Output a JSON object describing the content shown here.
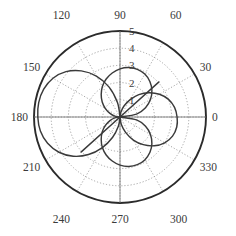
{
  "figure": {
    "kind": "polar-plot",
    "background_color": "#ffffff",
    "grid_color": "#8a8a8a",
    "outer_circle_color": "#2b2b2b",
    "curve_color": "#3a3a3a",
    "label_color": "#3b3b3b",
    "center": {
      "x": 120,
      "y": 117
    },
    "outer_radius_px": 86
  },
  "chart_data": {
    "type": "line",
    "plot_kind": "polar",
    "title": "",
    "xlabel": "",
    "ylabel": "",
    "grid": true,
    "legend_position": "none",
    "theta_unit": "degrees",
    "theta_tick_labels": [
      "0",
      "30",
      "60",
      "90",
      "120",
      "150",
      "180",
      "210",
      "240",
      "270",
      "300",
      "330"
    ],
    "theta_ticks": [
      0,
      30,
      60,
      90,
      120,
      150,
      180,
      210,
      240,
      270,
      300,
      330
    ],
    "r_tick_labels": [
      "1",
      "2",
      "3",
      "4",
      "5"
    ],
    "r_ticks": [
      1,
      2,
      3,
      4,
      5
    ],
    "rlim": [
      0,
      5
    ],
    "r_label_angle": 90,
    "series": [
      {
        "name": "pattern-lobe-left",
        "theta": [
          90,
          100,
          110,
          120,
          130,
          140,
          150,
          160,
          170,
          180,
          190,
          200,
          210,
          220,
          230,
          240,
          250,
          260,
          270
        ],
        "values": [
          0.0,
          0.85,
          1.85,
          2.75,
          3.5,
          4.1,
          4.5,
          4.72,
          4.8,
          4.78,
          4.7,
          4.48,
          4.1,
          3.55,
          2.85,
          2.05,
          1.25,
          0.55,
          0.0
        ]
      },
      {
        "name": "pattern-lobe-right",
        "theta": [
          270,
          280,
          290,
          300,
          310,
          320,
          330,
          340,
          350,
          0,
          10,
          20,
          30,
          40,
          50,
          60,
          70,
          80,
          90
        ],
        "values": [
          0.0,
          0.45,
          0.95,
          1.55,
          2.1,
          2.6,
          3.0,
          3.25,
          3.35,
          3.32,
          3.22,
          3.0,
          2.65,
          2.2,
          1.7,
          1.15,
          0.68,
          0.28,
          0.0
        ]
      },
      {
        "name": "pattern-cross-lobe-upper",
        "theta": [
          180,
          190,
          200,
          210,
          220,
          230,
          240,
          250,
          260,
          270,
          280,
          290,
          300,
          310,
          320,
          330,
          340,
          350,
          0
        ],
        "values": [
          0.0,
          0.3,
          0.62,
          0.98,
          1.35,
          1.7,
          2.05,
          2.35,
          2.6,
          2.8,
          2.92,
          2.95,
          2.88,
          2.7,
          2.42,
          2.05,
          1.58,
          0.98,
          0.0
        ]
      },
      {
        "name": "pattern-cross-lobe-lower",
        "theta": [
          0,
          10,
          20,
          30,
          40,
          50,
          60,
          70,
          80,
          90,
          100,
          110,
          120,
          130,
          140,
          150,
          160,
          170,
          180
        ],
        "values": [
          0.0,
          0.98,
          1.58,
          2.05,
          2.42,
          2.7,
          2.88,
          2.95,
          2.92,
          2.8,
          2.6,
          2.35,
          2.05,
          1.7,
          1.35,
          0.98,
          0.62,
          0.3,
          0.0
        ]
      },
      {
        "name": "lobe-chord-upper-right",
        "type": "segment",
        "theta_start": 0,
        "r_start": 0,
        "theta_end": 42,
        "r_end": 3.05
      },
      {
        "name": "lobe-chord-lower-left",
        "type": "segment",
        "theta_start": 180,
        "r_start": 0,
        "theta_end": 222,
        "r_end": 3.05
      }
    ]
  },
  "labels": {
    "angular": [
      {
        "text": "0",
        "angle": 0
      },
      {
        "text": "30",
        "angle": 30
      },
      {
        "text": "60",
        "angle": 60
      },
      {
        "text": "90",
        "angle": 90
      },
      {
        "text": "120",
        "angle": 120
      },
      {
        "text": "150",
        "angle": 150
      },
      {
        "text": "180",
        "angle": 180
      },
      {
        "text": "210",
        "angle": 210
      },
      {
        "text": "240",
        "angle": 240
      },
      {
        "text": "270",
        "angle": 270
      },
      {
        "text": "300",
        "angle": 300
      },
      {
        "text": "330",
        "angle": 330
      }
    ],
    "radial": [
      {
        "text": "1",
        "r": 1
      },
      {
        "text": "2",
        "r": 2
      },
      {
        "text": "3",
        "r": 3
      },
      {
        "text": "4",
        "r": 4
      },
      {
        "text": "5",
        "r": 5
      }
    ]
  }
}
